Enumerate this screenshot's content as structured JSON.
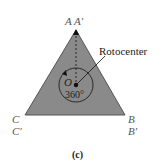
{
  "figure": {
    "caption": "(c)",
    "vertices": {
      "top": "A A′",
      "left_top": "C",
      "left_bottom": "C′",
      "right_top": "B",
      "right_bottom": "B′"
    },
    "center_label": "O",
    "angle_label": "360°",
    "callout": "Rotocenter",
    "colors": {
      "triangle_fill": "#8a8a8a",
      "triangle_stroke": "#555555",
      "line": "#111111"
    }
  }
}
